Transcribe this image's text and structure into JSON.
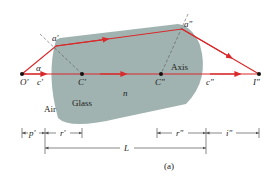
{
  "figure": {
    "caption": "(a)",
    "colors": {
      "glass": "#8fa6a2",
      "ray": "#d9292b",
      "dim": "#555555",
      "point": "#111111"
    },
    "regions": {
      "air": "Air",
      "glass": "Glass",
      "index": "n",
      "axis": "Axis"
    },
    "points": {
      "object": "O'",
      "center_left": "C'",
      "center_right": "C\"",
      "image": "I\"",
      "hit_left": "a'",
      "hit_right": "a\"",
      "angle": "α",
      "ray_left": "c'",
      "ray_right": "c\""
    },
    "dimensions": {
      "p_prime": "p'",
      "r_prime": "r'",
      "r_double": "r\"",
      "i_double": "i\"",
      "length": "L"
    }
  }
}
